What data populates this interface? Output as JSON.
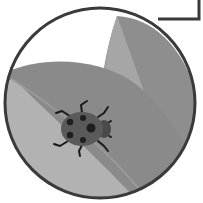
{
  "illustration": {
    "subject": "ladybug on leaves",
    "style": "grayscale flat illustration in circular frame",
    "colors": {
      "background": "#ffffff",
      "frame_stroke": "#3a3a3a",
      "leaf_light": "#a8a8a8",
      "leaf_mid": "#8c8c8c",
      "leaf_dark": "#7a7a7a",
      "circle_fill_light": "#b4b4b4",
      "ladybug_body": "#5a5a5a",
      "ladybug_head": "#4a4a4a",
      "ladybug_spots": "#1e1e1e",
      "ladybug_legs": "#1a1a1a"
    }
  },
  "icons": {
    "main": "ladybug-icon",
    "frame": "circle-frame",
    "corner_box": "corner-box-outline"
  }
}
